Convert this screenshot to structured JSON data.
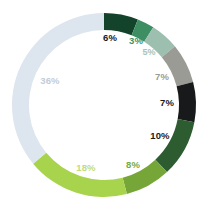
{
  "chart_data": {
    "type": "pie",
    "variant": "donut",
    "title": "",
    "subtitle": "",
    "xlabel": "",
    "ylabel": "",
    "legend": "none",
    "grid": false,
    "start_angle_deg": 0,
    "direction": "clockwise",
    "total": 100,
    "units": "%",
    "inner_radius_ratio": 0.8,
    "categories": [
      "Segment 1",
      "Segment 2",
      "Segment 3",
      "Segment 4",
      "Segment 5",
      "Segment 6",
      "Segment 7",
      "Segment 8",
      "Segment 9"
    ],
    "values": [
      6,
      3,
      5,
      7,
      7,
      10,
      8,
      18,
      36
    ],
    "slices": [
      {
        "label": "6%",
        "value": 6,
        "color": "#14432c",
        "label_color": "#1a1a1a",
        "label_weight": "bold",
        "label_size": 9.5,
        "label_x": 110,
        "label_y": 38
      },
      {
        "label": "3%",
        "value": 3,
        "color": "#3d8f63",
        "label_color": "#3d8f63",
        "label_weight": "bold",
        "label_size": 9.5,
        "label_x": 136,
        "label_y": 41
      },
      {
        "label": "5%",
        "value": 5,
        "color": "#9dbfb0",
        "label_color": "#a8c4b7",
        "label_weight": "bold",
        "label_size": 9,
        "label_x": 149,
        "label_y": 52
      },
      {
        "label": "7%",
        "value": 7,
        "color": "#9b9b96",
        "label_color": "#9b9b96",
        "label_weight": "bold",
        "label_size": 9.5,
        "label_x": 162,
        "label_y": 77
      },
      {
        "label": "7%",
        "value": 7,
        "color": "#17191a",
        "label_color": "#1a1a1a",
        "label_weight": "bold",
        "label_size": 9.5,
        "label_x": 167,
        "label_y": 103
      },
      {
        "label": "10%",
        "value": 10,
        "color": "#2d5c31",
        "label_color": "#1a1a1a",
        "label_weight": "bold",
        "label_size": 9.5,
        "label_x": 160,
        "label_y": 136
      },
      {
        "label": "8%",
        "value": 8,
        "color": "#76a637",
        "label_color": "#7aa93b",
        "label_weight": "bold",
        "label_size": 9.5,
        "label_x": 133,
        "label_y": 165
      },
      {
        "label": "18%",
        "value": 18,
        "color": "#a7d44c",
        "label_color": "#bedd7c",
        "label_weight": "bold",
        "label_size": 9.5,
        "label_x": 86,
        "label_y": 168
      },
      {
        "label": "36%",
        "value": 36,
        "color": "#dde5ee",
        "label_color": "#c3ccd8",
        "label_weight": "bold",
        "label_size": 9.5,
        "label_x": 50,
        "label_y": 81
      }
    ],
    "background_color": "#ffffff",
    "center": {
      "x": 104,
      "y": 105
    },
    "outer_radius": 92,
    "ring_thickness": 17
  }
}
